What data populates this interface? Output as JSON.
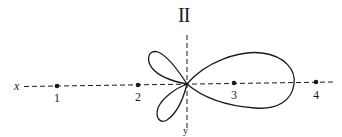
{
  "diagram": {
    "title": "II",
    "axis_labels": {
      "horizontal": "x",
      "vertical": "y"
    },
    "points": [
      {
        "label": "1",
        "x": 57,
        "y": 86
      },
      {
        "label": "2",
        "x": 138,
        "y": 85
      },
      {
        "label": "3",
        "x": 234,
        "y": 83
      },
      {
        "label": "4",
        "x": 316,
        "y": 82
      }
    ],
    "origin": {
      "x": 187,
      "y": 84
    },
    "lobes": [
      "upper-left small lobe",
      "lower-left small lobe",
      "large right lobe"
    ],
    "colors": {
      "ink": "#1a1a1a",
      "background": "#ffffff"
    }
  }
}
